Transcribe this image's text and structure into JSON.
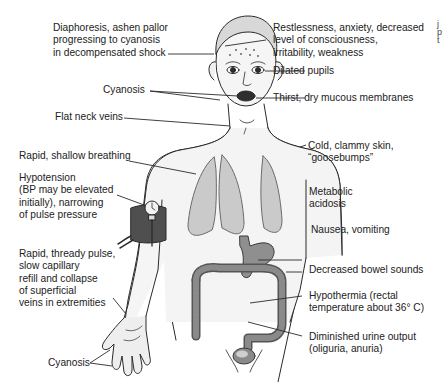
{
  "diagram": {
    "colors": {
      "line": "#2a2a2a",
      "skin": "#f4f4f4",
      "lung_fill": "#c9c9c9",
      "organ_fill": "#8a8a8a",
      "cuff_fill": "#555555",
      "text": "#222222"
    },
    "labels": {
      "diaphoresis": "Diaphoresis, ashen pallor\nprogressing to cyanosis\nin decompensated shock",
      "restlessness": "Restlessness, anxiety, decreased\nlevel of consciousness,\nirritability, weakness",
      "dilated_pupils": "Dilated pupils",
      "cyanosis_face": "Cyanosis",
      "thirst": "Thirst, dry mucous membranes",
      "flat_neck_veins": "Flat neck veins",
      "cold_clammy": "Cold, clammy skin,\n“goosebumps”",
      "rapid_breathing": "Rapid, shallow breathing",
      "hypotension": "Hypotension\n(BP may be elevated\ninitially), narrowing\nof pulse pressure",
      "metabolic_acidosis": "Metabolic\nacidosis",
      "nausea": "Nausea, vomiting",
      "thready_pulse": "Rapid, thready pulse,\nslow capillary\nrefill and collapse\nof superficial\nveins in extremities",
      "decreased_bowel": "Decreased bowel sounds",
      "hypothermia": "Hypothermia (rectal\ntemperature about 36° C)",
      "urine_output": "Diminished urine output\n(oliguria, anuria)",
      "cyanosis_hand": "Cyanosis"
    },
    "cropped_edge_text": "j\np\nt"
  }
}
